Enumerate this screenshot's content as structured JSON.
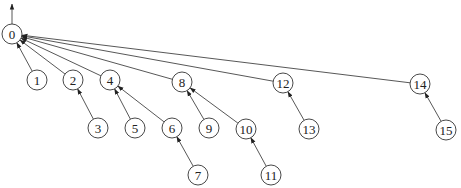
{
  "diagram": {
    "type": "tree",
    "root": "0",
    "node_radius": 10,
    "nodes": [
      {
        "id": "0",
        "label": "0",
        "x": 12,
        "y": 34
      },
      {
        "id": "1",
        "label": "1",
        "x": 37,
        "y": 80
      },
      {
        "id": "2",
        "label": "2",
        "x": 73,
        "y": 80
      },
      {
        "id": "4",
        "label": "4",
        "x": 110,
        "y": 80
      },
      {
        "id": "8",
        "label": "8",
        "x": 182,
        "y": 82
      },
      {
        "id": "12",
        "label": "12",
        "x": 283,
        "y": 83
      },
      {
        "id": "14",
        "label": "14",
        "x": 420,
        "y": 84
      },
      {
        "id": "3",
        "label": "3",
        "x": 98,
        "y": 128
      },
      {
        "id": "5",
        "label": "5",
        "x": 135,
        "y": 128
      },
      {
        "id": "6",
        "label": "6",
        "x": 172,
        "y": 128
      },
      {
        "id": "9",
        "label": "9",
        "x": 209,
        "y": 128
      },
      {
        "id": "10",
        "label": "10",
        "x": 246,
        "y": 129
      },
      {
        "id": "13",
        "label": "13",
        "x": 309,
        "y": 129
      },
      {
        "id": "15",
        "label": "15",
        "x": 446,
        "y": 130
      },
      {
        "id": "7",
        "label": "7",
        "x": 198,
        "y": 175
      },
      {
        "id": "11",
        "label": "11",
        "x": 271,
        "y": 175
      }
    ],
    "edges": [
      {
        "from": "1",
        "to": "0"
      },
      {
        "from": "2",
        "to": "0"
      },
      {
        "from": "4",
        "to": "0"
      },
      {
        "from": "8",
        "to": "0"
      },
      {
        "from": "12",
        "to": "0"
      },
      {
        "from": "14",
        "to": "0"
      },
      {
        "from": "3",
        "to": "2"
      },
      {
        "from": "5",
        "to": "4"
      },
      {
        "from": "6",
        "to": "4"
      },
      {
        "from": "9",
        "to": "8"
      },
      {
        "from": "10",
        "to": "8"
      },
      {
        "from": "13",
        "to": "12"
      },
      {
        "from": "15",
        "to": "14"
      },
      {
        "from": "7",
        "to": "6"
      },
      {
        "from": "11",
        "to": "10"
      }
    ],
    "root_arrow": {
      "x": 12,
      "y1": 24,
      "y2": 4
    }
  }
}
